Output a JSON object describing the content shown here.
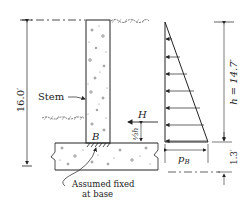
{
  "diagram": {
    "labels": {
      "wall_height": "16.0′",
      "stem": "Stem",
      "resultant": "H",
      "resultant_location": "⅓h",
      "base_point": "B",
      "base_pressure": "p",
      "base_pressure_sub": "B",
      "pressure_height": "h = 14.7′",
      "footing_thickness": "1.3′",
      "note_line1": "Assumed fixed",
      "note_line2": "at base"
    },
    "colors": {
      "line": "#222222",
      "background": "#ffffff"
    }
  }
}
